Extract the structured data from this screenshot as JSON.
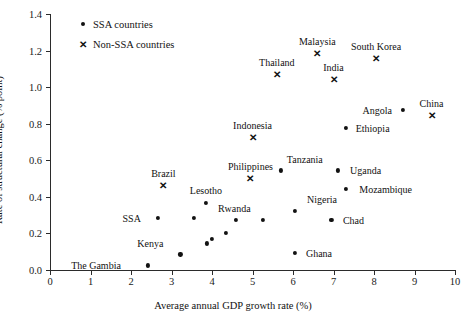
{
  "chart_data": {
    "type": "scatter",
    "title": "",
    "xlabel": "Average annual GDP growth rate (%)",
    "ylabel": "Rate of structural change (% point)",
    "xlim": [
      0,
      10
    ],
    "ylim": [
      0.0,
      1.4
    ],
    "xticks": [
      0,
      1,
      2,
      3,
      4,
      5,
      6,
      7,
      8,
      9,
      10
    ],
    "xtick_labels": [
      "0",
      "1",
      "2",
      "3",
      "4",
      "5",
      "6",
      "7",
      "8",
      "9",
      "10"
    ],
    "yticks": [
      0.0,
      0.2,
      0.4,
      0.6,
      0.8,
      1.0,
      1.2,
      1.4
    ],
    "ytick_labels": [
      "0.0",
      "0.2",
      "0.4",
      "0.6",
      "0.8",
      "1.0",
      "1.2",
      "1.4"
    ],
    "grid": false,
    "legend_position": "top-left",
    "series": [
      {
        "name": "SSA countries",
        "marker": "dot",
        "color": "#121212",
        "points": [
          {
            "label": "The Gambia",
            "x": 2.42,
            "y": 0.025,
            "label_dx": -52,
            "label_dy": 0
          },
          {
            "label": "SSA",
            "x": 2.66,
            "y": 0.285,
            "label_dx": -26,
            "label_dy": 0
          },
          {
            "label": "Lesotho",
            "x": 3.85,
            "y": 0.365,
            "label_dx": 0,
            "label_dy": -13
          },
          {
            "label": "Kenya",
            "x": 3.22,
            "y": 0.085,
            "label_dx": 0,
            "label_dy": 0,
            "label_hidden": true
          },
          {
            "label": "Uganda",
            "x": 7.1,
            "y": 0.545,
            "label_dx": 28,
            "label_dy": 0
          },
          {
            "label": "Mozambique",
            "x": 7.3,
            "y": 0.445,
            "label_dx": 40,
            "label_dy": 0
          },
          {
            "label": "Nigeria",
            "x": 6.05,
            "y": 0.325,
            "label_dx": 27,
            "label_dy": -12
          },
          {
            "label": "Tanzania",
            "x": 5.7,
            "y": 0.545,
            "label_dx": 24,
            "label_dy": -11
          },
          {
            "label": "Chad",
            "x": 6.95,
            "y": 0.275,
            "label_dx": 22,
            "label_dy": 0
          },
          {
            "label": "Ghana",
            "x": 6.05,
            "y": 0.095,
            "label_dx": 24,
            "label_dy": 0
          },
          {
            "label": "Ethiopia",
            "x": 7.3,
            "y": 0.775,
            "label_dx": 27,
            "label_dy": 0
          },
          {
            "label": "Angola",
            "x": 8.72,
            "y": 0.875,
            "label_dx": -26,
            "label_dy": 0
          },
          {
            "label": "Rwanda",
            "x": 4.6,
            "y": 0.275,
            "label_dx": 0,
            "label_dy": 0,
            "label_hidden": true
          },
          {
            "label": "",
            "x": 5.25,
            "y": 0.275,
            "label_dx": 0,
            "label_dy": 0
          },
          {
            "label": "",
            "x": 3.55,
            "y": 0.285,
            "label_dx": 0,
            "label_dy": 0
          },
          {
            "label": "",
            "x": 3.88,
            "y": 0.145,
            "label_dx": 0,
            "label_dy": 0
          },
          {
            "label": "",
            "x": 4.0,
            "y": 0.17,
            "label_dx": 0,
            "label_dy": 0
          },
          {
            "label": "",
            "x": 4.35,
            "y": 0.205,
            "label_dx": 0,
            "label_dy": 0
          }
        ]
      },
      {
        "name": "Non-SSA countries",
        "marker": "cross",
        "color": "#121212",
        "points": [
          {
            "label": "Brazil",
            "x": 2.8,
            "y": 0.46,
            "label_dx": 0,
            "label_dy": -13
          },
          {
            "label": "Philippines",
            "x": 4.95,
            "y": 0.5,
            "label_dx": 0,
            "label_dy": -13
          },
          {
            "label": "Indonesia",
            "x": 5.0,
            "y": 0.72,
            "label_dx": 0,
            "label_dy": -13
          },
          {
            "label": "Thailand",
            "x": 5.6,
            "y": 1.065,
            "label_dx": 0,
            "label_dy": -13
          },
          {
            "label": "Malaysia",
            "x": 6.6,
            "y": 1.18,
            "label_dx": 0,
            "label_dy": -13
          },
          {
            "label": "India",
            "x": 7.0,
            "y": 1.04,
            "label_dx": 0,
            "label_dy": -13
          },
          {
            "label": "South Korea",
            "x": 8.05,
            "y": 1.155,
            "label_dx": 0,
            "label_dy": -13
          },
          {
            "label": "China",
            "x": 9.42,
            "y": 0.84,
            "label_dx": 0,
            "label_dy": -13
          }
        ]
      }
    ]
  },
  "legend": {
    "items": [
      {
        "mark": "dot-marker",
        "label": "SSA countries"
      },
      {
        "mark": "cross-marker",
        "label": "Non-SSA countries"
      }
    ]
  }
}
